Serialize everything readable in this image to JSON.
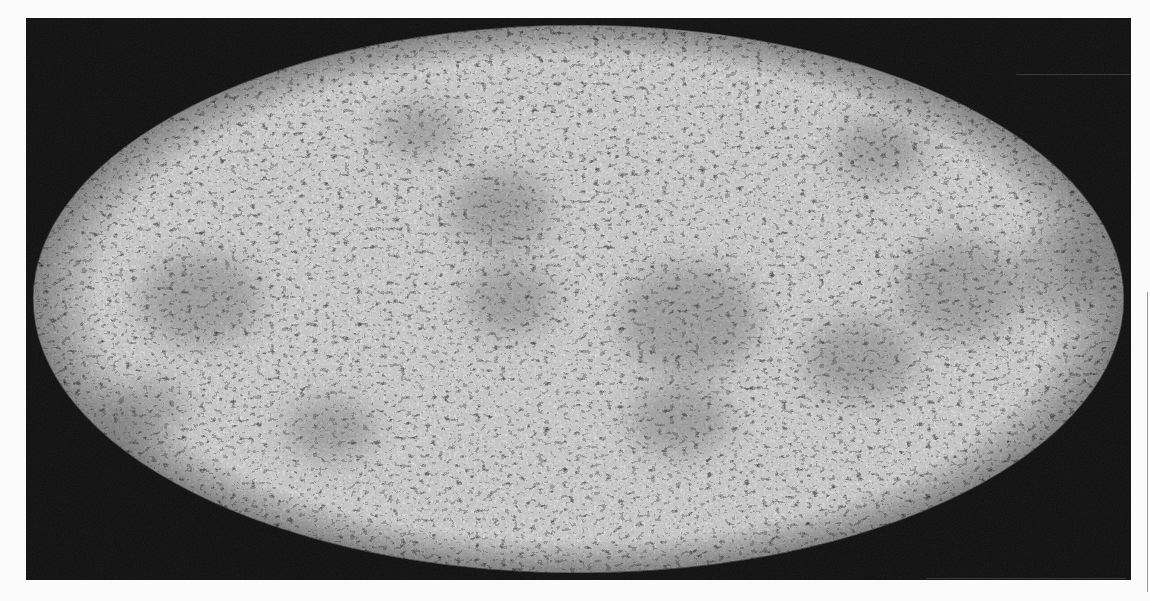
{
  "image": {
    "subject": "all-sky map in elliptical (Mollweide) projection with mottled temperature fluctuation texture",
    "projection": "mollweide",
    "colors": {
      "page_background": "#fbfbfb",
      "frame_background": "#0d0d0d",
      "ellipse_base": "#c8c8c8",
      "speckle_dark": "#3a3a3a",
      "edge_line": "#9a9a9a"
    },
    "geometry": {
      "frame": {
        "x": 26,
        "y": 18,
        "width": 1105,
        "height": 562
      },
      "ellipse": {
        "cx": 578.5,
        "cy": 299,
        "rx": 545.5,
        "ry": 274
      },
      "edge_line": {
        "x": 1147,
        "y": 292,
        "height": 300
      }
    },
    "dark_regions": [
      {
        "cx": 690,
        "cy": 320,
        "rx": 70,
        "ry": 55
      },
      {
        "cx": 860,
        "cy": 360,
        "rx": 55,
        "ry": 40
      },
      {
        "cx": 960,
        "cy": 290,
        "rx": 60,
        "ry": 50
      },
      {
        "cx": 510,
        "cy": 300,
        "rx": 45,
        "ry": 35
      },
      {
        "cx": 200,
        "cy": 300,
        "rx": 60,
        "ry": 45
      },
      {
        "cx": 145,
        "cy": 410,
        "rx": 40,
        "ry": 30
      },
      {
        "cx": 500,
        "cy": 210,
        "rx": 50,
        "ry": 40
      },
      {
        "cx": 680,
        "cy": 420,
        "rx": 50,
        "ry": 35
      },
      {
        "cx": 330,
        "cy": 430,
        "rx": 45,
        "ry": 30
      },
      {
        "cx": 880,
        "cy": 150,
        "rx": 45,
        "ry": 30
      },
      {
        "cx": 1060,
        "cy": 270,
        "rx": 40,
        "ry": 45
      },
      {
        "cx": 420,
        "cy": 130,
        "rx": 40,
        "ry": 25
      }
    ]
  }
}
